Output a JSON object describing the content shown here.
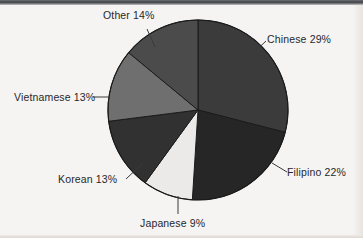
{
  "chart_data": {
    "type": "pie",
    "title": "",
    "subtitle": "",
    "xlabel": "",
    "ylabel": "",
    "legend_position": "none",
    "grid": false,
    "labels_show_percent": true,
    "start_angle_deg": 0,
    "direction": "clockwise",
    "categories": [
      "Chinese",
      "Filipino",
      "Japanese",
      "Korean",
      "Vietnamese",
      "Other"
    ],
    "values": [
      29,
      22,
      9,
      13,
      13,
      14
    ],
    "unit": "%",
    "slices": [
      {
        "name": "Chinese",
        "value": 29,
        "label": "Chinese 29%",
        "color": "#3b3b3c",
        "start_deg": 0.0,
        "end_deg": 104.4,
        "leader": true
      },
      {
        "name": "Filipino",
        "value": 22,
        "label": "Filipino 22%",
        "color": "#262627",
        "start_deg": 104.4,
        "end_deg": 183.6,
        "leader": true
      },
      {
        "name": "Japanese",
        "value": 9,
        "label": "Japanese 9%",
        "color": "#ebeae8",
        "start_deg": 183.6,
        "end_deg": 216.0,
        "leader": true
      },
      {
        "name": "Korean",
        "value": 13,
        "label": "Korean 13%",
        "color": "#313132",
        "start_deg": 216.0,
        "end_deg": 262.8,
        "leader": true
      },
      {
        "name": "Vietnamese",
        "value": 13,
        "label": "Vietnamese 13%",
        "color": "#6f6f70",
        "start_deg": 262.8,
        "end_deg": 309.6,
        "leader": true
      },
      {
        "name": "Other",
        "value": 14,
        "label": "Other 14%",
        "color": "#4b4b4c",
        "start_deg": 309.6,
        "end_deg": 360.0,
        "leader": true
      }
    ]
  },
  "labels": {
    "chinese": "Chinese 29%",
    "filipino": "Filipino 22%",
    "japanese": "Japanese 9%",
    "korean": "Korean 13%",
    "vietnamese": "Vietnamese 13%",
    "other": "Other 14%"
  },
  "colors": {
    "background": "#f6f4f2",
    "outline": "#1b1b1c",
    "leader_line": "#3a3a3b",
    "text": "#26282b",
    "chinese": "#3b3b3c",
    "filipino": "#262627",
    "japanese": "#ebeae8",
    "korean": "#313132",
    "vietnamese": "#6f6f70",
    "other": "#4b4b4c"
  },
  "geometry": {
    "center_x": 198,
    "center_y": 110,
    "radius": 90
  }
}
